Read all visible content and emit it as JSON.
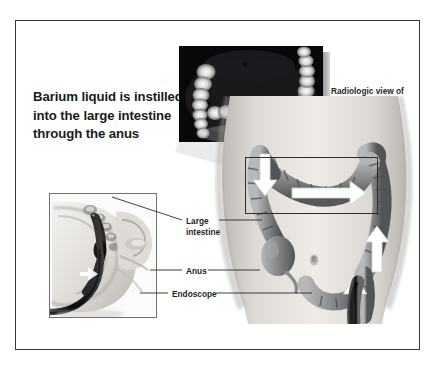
{
  "figure": {
    "headline": "Barium liquid is instilled into the large intestine through the anus",
    "frame_color": "#3a3a3a",
    "background": "#ffffff",
    "text_color": "#1a1a1a"
  },
  "radiograph": {
    "name": "barium-enema-radiograph",
    "caption": "Radiologic view of barium enema",
    "background": "#07070a",
    "contrast_color": "#f2f2f2"
  },
  "torso": {
    "name": "abdomen-with-large-intestine",
    "skin_tone": "#d8d4cf",
    "colon_tone": "#8a8a8a",
    "arrow_color": "#ffffff"
  },
  "inset": {
    "name": "sagittal-pelvis-inset",
    "border_color": "#707070",
    "endoscope_color": "#141414"
  },
  "zoom_box": {
    "name": "colon-detail-highlight",
    "border_color": "#2e2e2e"
  },
  "annotations": [
    {
      "id": "large-intestine",
      "label_line1": "Large",
      "label_line2": "intestine"
    },
    {
      "id": "anus",
      "label_line1": "Anus",
      "label_line2": ""
    },
    {
      "id": "endoscope",
      "label_line1": "Endoscope",
      "label_line2": ""
    }
  ],
  "leader_line_color": "#2a2a2a"
}
